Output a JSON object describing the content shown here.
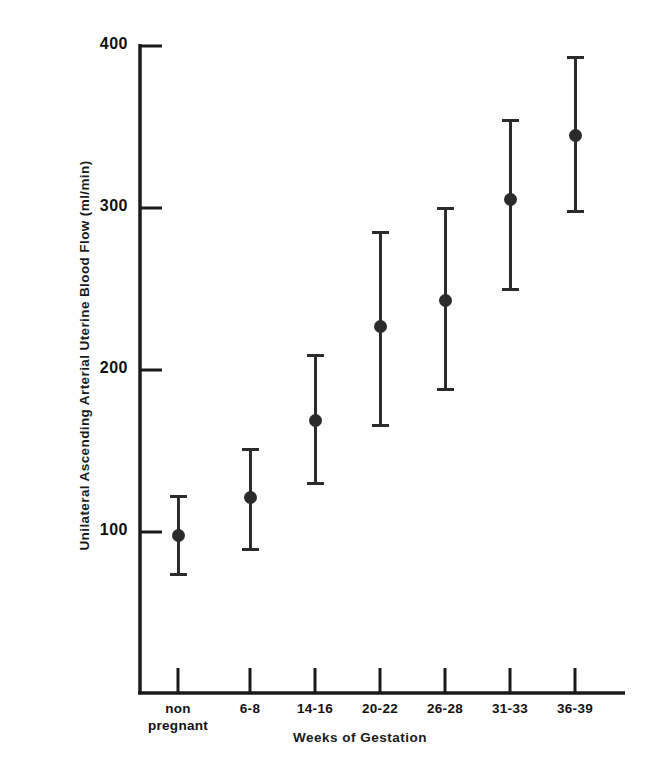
{
  "chart_data": {
    "type": "scatter",
    "title": "",
    "xlabel": "Weeks of Gestation",
    "ylabel": "Unilateral Ascending Arterial Uterine Blood Flow (ml/min)",
    "categories": [
      "non pregnant",
      "6-8",
      "14-16",
      "20-22",
      "26-28",
      "31-33",
      "36-39"
    ],
    "category_lines": [
      [
        "non",
        "pregnant"
      ],
      [
        "6-8"
      ],
      [
        "14-16"
      ],
      [
        "20-22"
      ],
      [
        "26-28"
      ],
      [
        "31-33"
      ],
      [
        "36-39"
      ]
    ],
    "values": [
      98,
      121,
      169,
      227,
      243,
      305,
      345
    ],
    "error_low": [
      74,
      89,
      130,
      166,
      188,
      250,
      298
    ],
    "error_high": [
      122,
      151,
      209,
      285,
      300,
      354,
      393
    ],
    "ylim": [
      0,
      410
    ],
    "ytick_labels": [
      "100",
      "200",
      "300",
      "400"
    ],
    "ytick_values": [
      100,
      200,
      300,
      400
    ],
    "grid": false,
    "legend": "none",
    "marker": "filled-circle",
    "series_name": "Uterine blood flow",
    "color": "#2b2b2b"
  },
  "figure": {
    "background": "#ffffff",
    "axis_color": "#1a1a1a"
  }
}
